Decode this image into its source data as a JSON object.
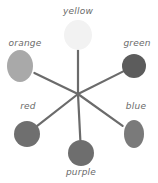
{
  "diagram": {
    "type": "color-wheel",
    "center": [
      78,
      94
    ],
    "colors": [
      {
        "name": "yellow",
        "label": "yellow",
        "tone": "#f2f2f2",
        "blob": [
          78,
          35,
          14,
          15
        ],
        "label_pos": [
          78,
          15
        ]
      },
      {
        "name": "green",
        "label": "green",
        "tone": "#5c5c5c",
        "blob": [
          134,
          66,
          12,
          12
        ],
        "label_pos": [
          137,
          47
        ]
      },
      {
        "name": "blue",
        "label": "blue",
        "tone": "#7a7a7a",
        "blob": [
          134,
          134,
          10,
          14
        ],
        "label_pos": [
          136,
          110
        ]
      },
      {
        "name": "purple",
        "label": "purple",
        "tone": "#6e6e6e",
        "blob": [
          81,
          153,
          13,
          13
        ],
        "label_pos": [
          81,
          176
        ]
      },
      {
        "name": "red",
        "label": "red",
        "tone": "#6f6f6f",
        "blob": [
          27,
          134,
          13,
          13
        ],
        "label_pos": [
          28,
          110
        ]
      },
      {
        "name": "orange",
        "label": "orange",
        "tone": "#a9a9a9",
        "blob": [
          20,
          66,
          13,
          16
        ],
        "label_pos": [
          25,
          47
        ]
      }
    ],
    "spoke_color": "#6b6b6b"
  }
}
